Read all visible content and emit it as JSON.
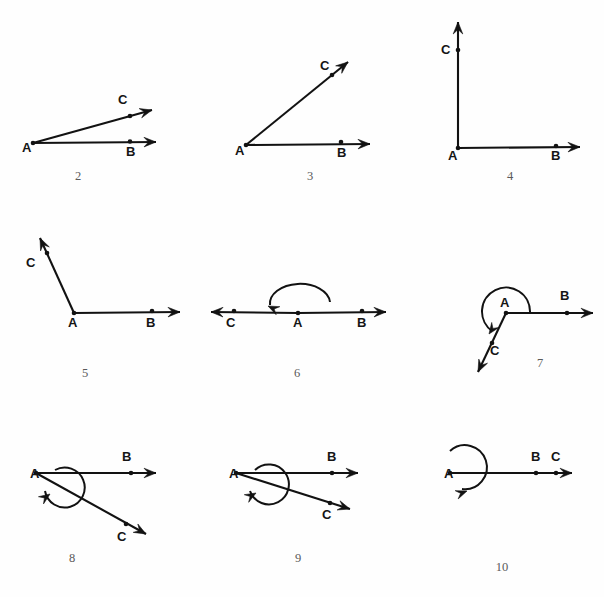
{
  "page": {
    "background_color": "#fefefe",
    "ink_color": "#121212",
    "figure_number_color": "#5a5a5a",
    "width": 604,
    "height": 597
  },
  "figures": [
    {
      "number": "2",
      "caption_pos": [
        78,
        180
      ],
      "description": "Acute angle BAC, small opening; ray AB horizontal right, ray AC shallow up-right",
      "vertex": {
        "label": "A",
        "label_pos": [
          22,
          152
        ],
        "point": [
          33,
          143
        ]
      },
      "rays": [
        {
          "name": "ray-AB",
          "end_label": "B",
          "label_pos": [
            126,
            156
          ],
          "from": [
            33,
            143
          ],
          "to": [
            156,
            142
          ],
          "mark_point": [
            130,
            141.5
          ],
          "arrow": true
        },
        {
          "name": "ray-AC",
          "end_label": "C",
          "label_pos": [
            118,
            104
          ],
          "from": [
            33,
            143
          ],
          "to": [
            152,
            110
          ],
          "mark_point": [
            130,
            116
          ],
          "arrow": true
        }
      ],
      "arc": null
    },
    {
      "number": "3",
      "caption_pos": [
        310,
        180
      ],
      "description": "Acute angle BAC about 45 degrees; ray AB horizontal right, ray AC up-right diagonal",
      "vertex": {
        "label": "A",
        "label_pos": [
          235,
          155
        ],
        "point": [
          246,
          145
        ]
      },
      "rays": [
        {
          "name": "ray-AB",
          "end_label": "B",
          "label_pos": [
            337,
            157
          ],
          "from": [
            246,
            145
          ],
          "to": [
            370,
            144
          ],
          "mark_point": [
            341,
            142
          ],
          "arrow": true
        },
        {
          "name": "ray-AC",
          "end_label": "C",
          "label_pos": [
            320,
            70
          ],
          "from": [
            246,
            145
          ],
          "to": [
            348,
            62
          ],
          "mark_point": [
            332,
            75
          ],
          "arrow": true
        }
      ],
      "arc": null
    },
    {
      "number": "4",
      "caption_pos": [
        510,
        180
      ],
      "description": "Right angle BAC, 90 degrees; ray AB horizontal right, ray AC vertical up",
      "vertex": {
        "label": "A",
        "label_pos": [
          448,
          160
        ],
        "point": [
          458,
          148
        ]
      },
      "rays": [
        {
          "name": "ray-AB",
          "end_label": "B",
          "label_pos": [
            551,
            160
          ],
          "from": [
            458,
            148
          ],
          "to": [
            580,
            147
          ],
          "mark_point": [
            556,
            146
          ],
          "arrow": true
        },
        {
          "name": "ray-AC",
          "end_label": "C",
          "label_pos": [
            441,
            54
          ],
          "from": [
            458,
            148
          ],
          "to": [
            458,
            22
          ],
          "mark_point": [
            458,
            50
          ],
          "arrow": true
        }
      ],
      "arc": null
    },
    {
      "number": "5",
      "caption_pos": [
        85,
        377
      ],
      "description": "Obtuse angle BAC; ray AB horizontal right, ray AC steeply up-left",
      "vertex": {
        "label": "A",
        "label_pos": [
          68,
          327
        ],
        "point": [
          74,
          313
        ]
      },
      "rays": [
        {
          "name": "ray-AB",
          "end_label": "B",
          "label_pos": [
            146,
            327
          ],
          "from": [
            74,
            313
          ],
          "to": [
            180,
            312
          ],
          "mark_point": [
            152,
            311
          ],
          "arrow": true
        },
        {
          "name": "ray-AC",
          "end_label": "C",
          "label_pos": [
            26,
            267
          ],
          "from": [
            74,
            313
          ],
          "to": [
            40,
            238
          ],
          "mark_point": [
            47,
            253
          ],
          "arrow": true
        }
      ],
      "arc": null
    },
    {
      "number": "6",
      "caption_pos": [
        297,
        377
      ],
      "description": "Straight angle 180 degrees; C, A, B collinear on a double-headed line with curved arc above A turning counterclockwise",
      "vertex": {
        "label": "A",
        "label_pos": [
          293,
          327
        ],
        "point": [
          298,
          313
        ]
      },
      "rays": [
        {
          "name": "ray-AB",
          "end_label": "B",
          "label_pos": [
            357,
            327
          ],
          "from": [
            298,
            313
          ],
          "to": [
            386,
            312
          ],
          "mark_point": [
            362,
            311
          ],
          "arrow": true
        },
        {
          "name": "ray-AC",
          "end_label": "C",
          "label_pos": [
            226,
            327
          ],
          "from": [
            298,
            313
          ],
          "to": [
            211,
            312
          ],
          "mark_point": [
            234,
            311
          ],
          "arrow": true
        }
      ],
      "arc": {
        "name": "straight-angle-arc",
        "path": "M 330 302 A 26 17 0 1 0 270 305",
        "arrow_tip": [
          268,
          306
        ],
        "arrow_angle": 205
      }
    },
    {
      "number": "7",
      "caption_pos": [
        540,
        367
      ],
      "description": "Reflex-looking obtuse angle BAC measured counterclockwise; ray AB horizontal right, ray AC down-left, arc over the top",
      "vertex": {
        "label": "A",
        "label_pos": [
          500,
          307
        ],
        "point": [
          506,
          313
        ]
      },
      "rays": [
        {
          "name": "ray-AB",
          "end_label": "B",
          "label_pos": [
            560,
            300
          ],
          "from": [
            506,
            313
          ],
          "to": [
            593,
            313
          ],
          "mark_point": [
            567,
            313
          ],
          "arrow": true
        },
        {
          "name": "ray-AC",
          "end_label": "C",
          "label_pos": [
            490,
            355
          ],
          "from": [
            506,
            313
          ],
          "to": [
            478,
            372
          ],
          "mark_point": [
            492,
            343
          ],
          "arrow": true
        }
      ],
      "arc": {
        "name": "reflex-angle-arc",
        "path": "M 530 312 A 24 24 0 1 0 492 331",
        "arrow_tip": [
          489,
          334
        ],
        "arrow_angle": 125
      }
    },
    {
      "number": "8",
      "caption_pos": [
        72,
        562
      ],
      "description": "Large reflex angle BAC; ray AB horizontal right, ray AC down-right, near full-circle arc around A",
      "vertex": {
        "label": "A",
        "label_pos": [
          30,
          478
        ],
        "point": [
          36,
          473
        ]
      },
      "rays": [
        {
          "name": "ray-AB",
          "end_label": "B",
          "label_pos": [
            122,
            461
          ],
          "from": [
            36,
            473
          ],
          "to": [
            156,
            473
          ],
          "mark_point": [
            131,
            473
          ],
          "arrow": true
        },
        {
          "name": "ray-AC",
          "end_label": "C",
          "label_pos": [
            117,
            541
          ],
          "from": [
            36,
            473
          ],
          "to": [
            146,
            534
          ],
          "mark_point": [
            126,
            524
          ],
          "arrow": true
        }
      ],
      "arc": {
        "name": "reflex-angle-arc",
        "path": "M 55 470 A 20 20 0 1 1 45 491",
        "arrow_tip": [
          50,
          494
        ],
        "arrow_angle": 325
      }
    },
    {
      "number": "9",
      "caption_pos": [
        298,
        562
      ],
      "description": "Large reflex angle BAC, slightly smaller opening than figure 8; ray AB horizontal right, ray AC shallow down-right, near full-circle arc around A",
      "vertex": {
        "label": "A",
        "label_pos": [
          229,
          478
        ],
        "point": [
          236,
          473
        ]
      },
      "rays": [
        {
          "name": "ray-AB",
          "end_label": "B",
          "label_pos": [
            327,
            461
          ],
          "from": [
            236,
            473
          ],
          "to": [
            358,
            473
          ],
          "mark_point": [
            332,
            473
          ],
          "arrow": true
        },
        {
          "name": "ray-AC",
          "end_label": "C",
          "label_pos": [
            322,
            519
          ],
          "from": [
            236,
            473
          ],
          "to": [
            350,
            509
          ],
          "mark_point": [
            330,
            503
          ],
          "arrow": true
        }
      ],
      "arc": {
        "name": "reflex-angle-arc",
        "path": "M 255 470 A 20 20 0 1 1 250 491",
        "arrow_tip": [
          256,
          493
        ],
        "arrow_angle": 330
      }
    },
    {
      "number": "10",
      "caption_pos": [
        502,
        571
      ],
      "description": "Full rotation 360 degrees; rays AB and AC coincide on one horizontal ray, full circle arc around A",
      "vertex": {
        "label": "A",
        "label_pos": [
          444,
          478
        ],
        "point": [
          450,
          473
        ]
      },
      "rays": [
        {
          "name": "ray-AB-AC",
          "end_label": "B",
          "label_pos": [
            531,
            461
          ],
          "from": [
            450,
            473
          ],
          "to": [
            572,
            473
          ],
          "mark_point": [
            536,
            473
          ],
          "arrow": true
        },
        {
          "name": "ray-point-C",
          "end_label": "C",
          "label_pos": [
            551,
            461
          ],
          "from": null,
          "to": null,
          "mark_point": [
            556,
            473
          ],
          "arrow": false
        }
      ],
      "arc": {
        "name": "full-rotation-arc",
        "path": "M 450 451 A 22 22 0 1 1 462 489",
        "arrow_tip": [
          467,
          491
        ],
        "arrow_angle": 340
      }
    }
  ]
}
